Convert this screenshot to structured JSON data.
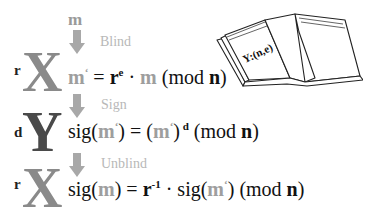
{
  "diagram": {
    "input_message": "m",
    "colors": {
      "blinding_party": "#8a8a8a",
      "signer": "#4a4a4a",
      "arrow": "#a8a8a8",
      "step_label": "#b8b8b8",
      "message": "#9e9e9e"
    },
    "book": {
      "label": "Y:(n,e)",
      "icon": "open-book-icon"
    },
    "steps": [
      {
        "actor": "X",
        "actor_prefix": "r",
        "label": "Blind",
        "eq": {
          "lhs_m": "m",
          "lhs_prime": "‘",
          "eqsign": " = ",
          "r": "r",
          "r_sup": "e",
          "dot": " · ",
          "m": "m",
          "mod_open": " (mod ",
          "n": "n",
          "mod_close": ")"
        }
      },
      {
        "actor": "Y",
        "actor_prefix": "d",
        "label": "Sign",
        "eq": {
          "sig": "sig(",
          "m": "m",
          "prime": "‘",
          "close": ")",
          "eqsign": " = (",
          "m2": "m",
          "prime2": "‘",
          "close2": ")",
          "sup": " d",
          "mod_open": " (mod ",
          "n": "n",
          "mod_close": ")"
        }
      },
      {
        "actor": "X",
        "actor_prefix": "r",
        "label": "Unblind",
        "eq": {
          "sig": "sig(",
          "m": "m",
          "close": ")",
          "eqsign": " = ",
          "r": "r",
          "r_sup": "-1",
          "dot": " · ",
          "sig2": "sig(",
          "m2": "m",
          "prime2": "‘",
          "close2": ")",
          "mod_open": " (mod ",
          "n": "n",
          "mod_close": ")"
        }
      }
    ]
  }
}
